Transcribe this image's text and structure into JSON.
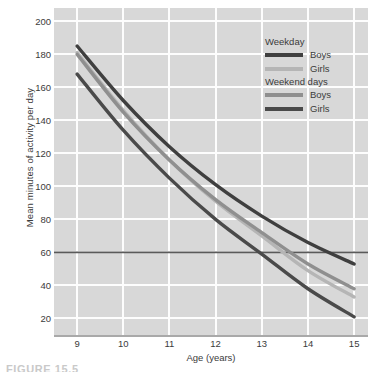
{
  "chart_data": {
    "type": "line",
    "title": "",
    "xlabel": "Age (years)",
    "ylabel": "Mean minutes of activity per day",
    "xlim": [
      8.5,
      15.3
    ],
    "ylim": [
      10,
      208
    ],
    "xticks": [
      9,
      10,
      11,
      12,
      13,
      14,
      15
    ],
    "yticks": [
      20,
      40,
      60,
      80,
      100,
      120,
      140,
      160,
      180,
      200
    ],
    "grid": true,
    "legend_position": "top-right",
    "x": [
      9,
      10,
      11,
      12,
      13,
      14,
      15
    ],
    "series": [
      {
        "name": "Weekday Boys",
        "group": "Weekday",
        "sex": "Boys",
        "color": "#3f3f3f",
        "values": [
          185,
          152,
          124,
          101,
          82,
          66,
          53
        ]
      },
      {
        "name": "Weekday Girls",
        "group": "Weekday",
        "sex": "Girls",
        "color": "#b5b5b5",
        "values": [
          181,
          146,
          116,
          91,
          70,
          49,
          33
        ]
      },
      {
        "name": "Weekend days Boys",
        "group": "Weekend days",
        "sex": "Boys",
        "color": "#8f8f8f",
        "values": [
          180,
          145,
          116,
          92,
          72,
          53,
          38
        ]
      },
      {
        "name": "Weekend days Girls",
        "group": "Weekend days",
        "sex": "Girls",
        "color": "#4a4a4a",
        "values": [
          168,
          134,
          105,
          80,
          59,
          38,
          21
        ]
      }
    ],
    "reference_line": {
      "name": "60 minutes per day guideline",
      "orientation": "horizontal",
      "value": 60,
      "color": "#5a5a5a"
    }
  },
  "axes": {
    "y_title": "Mean minutes of activity per day",
    "x_title": "Age (years)",
    "y_tick_labels": [
      "200",
      "180",
      "160",
      "140",
      "120",
      "100",
      "80",
      "60",
      "40",
      "20"
    ],
    "x_tick_labels": [
      "9",
      "10",
      "11",
      "12",
      "13",
      "14",
      "15"
    ]
  },
  "legend": {
    "groups": [
      {
        "title": "Weekday",
        "entries": [
          {
            "label": "Boys",
            "color": "#3f3f3f"
          },
          {
            "label": "Girls",
            "color": "#b5b5b5"
          }
        ]
      },
      {
        "title": "Weekend days",
        "entries": [
          {
            "label": "Boys",
            "color": "#8f8f8f"
          },
          {
            "label": "Girls",
            "color": "#4a4a4a"
          }
        ]
      }
    ]
  },
  "colors": {
    "plot_background": "#d8d8d8",
    "gridline": "#fdfdfd",
    "text": "#3b3b3b",
    "axis_line": "#a9a9a9"
  },
  "caption": {
    "text": "FIGURE 15.5"
  }
}
